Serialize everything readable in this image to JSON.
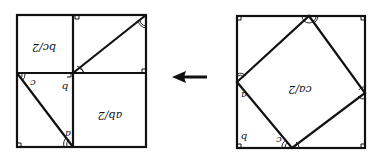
{
  "left_figure": {
    "regions": {
      "top_left": "bc/2",
      "bottom_right": "ab/2"
    },
    "side_labels": [
      "a",
      "b",
      "c"
    ]
  },
  "right_figure": {
    "center": "ca/2",
    "side_labels": [
      "a",
      "b",
      "c"
    ]
  },
  "arrow": {
    "direction": "left"
  },
  "colors": {
    "stroke": "#111111",
    "background": "#ffffff"
  }
}
